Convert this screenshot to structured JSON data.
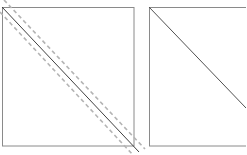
{
  "diagram": {
    "colors": {
      "frame": "#8a8a8a",
      "diagonal": "#404040",
      "dashed": "#b4b4b4",
      "background": "#ffffff"
    },
    "left_square": {
      "x": 2,
      "y": 7,
      "size": 132,
      "solid_diagonal": {
        "x1": 2,
        "y1": 7,
        "x2": 139,
        "y2": 152
      },
      "dashed_offsets_px": [
        -6,
        6
      ]
    },
    "right_square": {
      "x": 149,
      "y": 7,
      "width": 100,
      "height": 139,
      "solid_diagonal": {
        "x1": 149,
        "y1": 7,
        "x2": 246,
        "y2": 108
      }
    }
  }
}
